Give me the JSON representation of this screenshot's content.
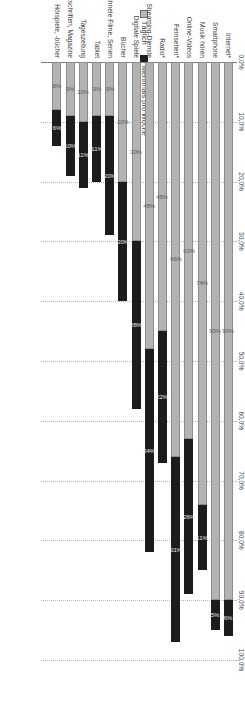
{
  "chart_data": {
    "type": "bar",
    "subtype": "stacked-horizontal",
    "title": "",
    "xlabel": "",
    "ylabel": "Mehrmals pro Woche",
    "axis_title": "Mehrmals pro Woche",
    "xlim": [
      0,
      100
    ],
    "grid": true,
    "grid_style": "dotted",
    "legend_position": "left",
    "tick_labels": [
      "0,0%",
      "10,0%",
      "20,0%",
      "30,0%",
      "40,0%",
      "50,0%",
      "60,0%",
      "70,0%",
      "80,0%",
      "90,0%",
      "100,0%"
    ],
    "tick_values": [
      0,
      10,
      20,
      30,
      40,
      50,
      60,
      70,
      80,
      90,
      100
    ],
    "categories": [
      "Internet*",
      "Smartphone",
      "Musik hören",
      "Online-Videos",
      "Fernsehen*",
      "Radio*",
      "Streaming-Dienste",
      "Digitale Spiele",
      "Bücher",
      "DVD, Blu-ays, aufgezeichnete Filme, Serien",
      "Tablet",
      "Tageszeitung",
      "Zeitschriften, Magazine",
      "Hörspiele, -bücher"
    ],
    "series": [
      {
        "name": "Täglich",
        "color": "#b3b3b3",
        "values": [
          90,
          90,
          74,
          63,
          66,
          45,
          48,
          30,
          20,
          9,
          9,
          10,
          9,
          8
        ],
        "labels": [
          "90%",
          "90%",
          "74%",
          "63%",
          "66%",
          "45%",
          "48%",
          "30%",
          "20%",
          "9%",
          "9%",
          "10%",
          "9%",
          "8%"
        ],
        "labels_visible": [
          true,
          true,
          true,
          true,
          true,
          true,
          true,
          true,
          true,
          true,
          true,
          true,
          true,
          true
        ]
      },
      {
        "name": "Mehrmals pro Woche",
        "color": "#1c1c1c",
        "values": [
          6,
          5,
          11,
          26,
          31,
          22,
          34,
          28,
          20,
          20,
          11,
          11,
          10,
          6
        ],
        "labels": [
          "6%",
          "5%",
          "11%",
          "26%",
          "31%",
          "22%",
          "34%",
          "28%",
          "20%",
          "20%",
          "11%",
          "11%",
          "10%",
          "6%"
        ],
        "labels_visible": [
          true,
          true,
          true,
          true,
          true,
          true,
          true,
          true,
          true,
          true,
          true,
          true,
          true,
          true
        ]
      }
    ],
    "totals": [
      96,
      95,
      85,
      89,
      97,
      67,
      82,
      58,
      40,
      29,
      20,
      21,
      19,
      14
    ]
  },
  "legend": {
    "items": [
      {
        "label": "Täglich",
        "key": "taeglich"
      },
      {
        "label": "Mehrmals pro Woche",
        "key": "mehrmals"
      }
    ]
  },
  "colors": {
    "taeglich": "#b3b3b3",
    "mehrmals": "#1c1c1c",
    "grid": "#b6b6c8",
    "axis": "#7d7d7d",
    "text": "#3d3d3d",
    "background": "#ffffff"
  }
}
